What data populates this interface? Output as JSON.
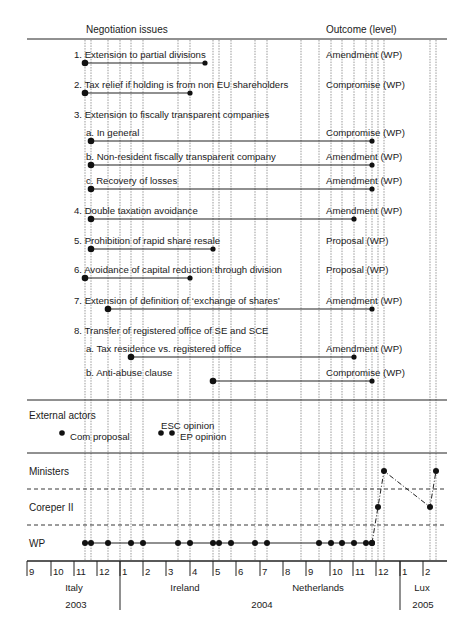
{
  "header": {
    "issues_title": "Negotiation issues",
    "outcome_title": "Outcome (level)"
  },
  "issues": [
    {
      "label": "1. Extension to partial divisions",
      "outcome": "Amendment (WP)",
      "y": 63,
      "start": 85,
      "end": 205,
      "label_x": 74
    },
    {
      "label": "2. Tax relief if holding is from non EU shareholders",
      "outcome": "Compromise (WP)",
      "y": 93,
      "start": 85,
      "end": 190,
      "label_x": 74
    },
    {
      "label": "3. Extension to fiscally transparent companies",
      "outcome": "",
      "y": null,
      "start": null,
      "end": null,
      "label_x": 74,
      "text_y": 118
    },
    {
      "label": "a. In general",
      "outcome": "Compromise (WP)",
      "y": 141,
      "start": 91,
      "end": 372,
      "label_x": 86
    },
    {
      "label": "b. Non-resident fiscally transparent company",
      "outcome": "Amendment (WP)",
      "y": 165,
      "start": 91,
      "end": 372,
      "label_x": 86
    },
    {
      "label": "c. Recovery of losses",
      "outcome": "Amendment (WP)",
      "y": 189,
      "start": 91,
      "end": 372,
      "label_x": 86
    },
    {
      "label": "4. Double taxation avoidance",
      "outcome": "Amendment (WP)",
      "y": 219,
      "start": 91,
      "end": 354,
      "label_x": 74
    },
    {
      "label": "5. Prohibition of rapid share resale",
      "outcome": "Proposal (WP)",
      "y": 249,
      "start": 91,
      "end": 213,
      "label_x": 74
    },
    {
      "label": "6. Avoidance of capital reduction through division",
      "outcome": "Proposal (WP)",
      "y": 278,
      "start": 85,
      "end": 190,
      "label_x": 74
    },
    {
      "label": "7. Extension of definition of ‘exchange of shares’",
      "outcome": "Amendment (WP)",
      "y": 309,
      "start": 108,
      "end": 372,
      "label_x": 74
    },
    {
      "label": "8. Transfer of registered office of SE and SCE",
      "outcome": "",
      "y": null,
      "start": null,
      "end": null,
      "label_x": 74,
      "text_y": 334
    },
    {
      "label": "a. Tax residence vs. registered office",
      "outcome": "Amendment (WP)",
      "y": 357,
      "start": 131,
      "end": 354,
      "label_x": 86
    },
    {
      "label": "b. Anti-abuse clause",
      "outcome": "Compromise (WP)",
      "y": 381,
      "start": 213,
      "end": 372,
      "label_x": 86
    }
  ],
  "external_actors": {
    "title": "External actors",
    "events": [
      {
        "label": "Com proposal",
        "x": 62,
        "y": 433,
        "label_dx": 8,
        "label_dy": 7
      },
      {
        "label": "ESC opinion",
        "x": 161,
        "y": 433,
        "label_dx": 0,
        "label_dy": -4
      },
      {
        "label": "EP opinion",
        "x": 172,
        "y": 433,
        "label_dx": 8,
        "label_dy": 7
      }
    ]
  },
  "levels": {
    "ministers": "Ministers",
    "coreper": "Coreper II",
    "wp": "WP"
  },
  "wp_meetings_x": [
    85,
    91,
    108,
    131,
    143,
    178,
    190,
    213,
    219,
    231,
    255,
    267,
    319,
    331,
    342,
    354,
    366,
    372
  ],
  "escalation_path": [
    {
      "x": 372,
      "y": 543,
      "level": "WP"
    },
    {
      "x": 378,
      "y": 507,
      "level": "Coreper II"
    },
    {
      "x": 384,
      "y": 471,
      "level": "Ministers"
    },
    {
      "x": 430,
      "y": 507,
      "level": "Coreper II"
    },
    {
      "x": 436,
      "y": 471,
      "level": "Ministers"
    }
  ],
  "vertical_lines_x": [
    85,
    91,
    108,
    120,
    131,
    143,
    178,
    190,
    213,
    219,
    231,
    255,
    267,
    301,
    319,
    331,
    342,
    354,
    366,
    372,
    378,
    384,
    430,
    436
  ],
  "timeline": {
    "months": [
      {
        "label": "9",
        "x": 27
      },
      {
        "label": "10",
        "x": 51
      },
      {
        "label": "11",
        "x": 74
      },
      {
        "label": "12",
        "x": 97
      },
      {
        "label": "1",
        "x": 120
      },
      {
        "label": "2",
        "x": 143
      },
      {
        "label": "3",
        "x": 166
      },
      {
        "label": "4",
        "x": 190
      },
      {
        "label": "5",
        "x": 213
      },
      {
        "label": "6",
        "x": 236
      },
      {
        "label": "7",
        "x": 260
      },
      {
        "label": "8",
        "x": 283
      },
      {
        "label": "9",
        "x": 306
      },
      {
        "label": "10",
        "x": 330
      },
      {
        "label": "11",
        "x": 353
      },
      {
        "label": "12",
        "x": 376
      },
      {
        "label": "1",
        "x": 400
      },
      {
        "label": "2",
        "x": 423
      }
    ],
    "presidencies": [
      {
        "label": "Italy",
        "x": 74
      },
      {
        "label": "Ireland",
        "x": 185
      },
      {
        "label": "Netherlands",
        "x": 318
      },
      {
        "label": "Lux",
        "x": 422
      }
    ],
    "years": [
      {
        "label": "2003",
        "x": 76
      },
      {
        "label": "2004",
        "x": 262
      },
      {
        "label": "2005",
        "x": 423
      }
    ]
  },
  "chart_data": {
    "type": "timeline",
    "title": "",
    "x_axis": {
      "unit": "month",
      "range": [
        "2003-09",
        "2005-02"
      ]
    },
    "rows": [
      {
        "issue": "1. Extension to partial divisions",
        "start": "2003-11",
        "end": "2004-05",
        "outcome": "Amendment (WP)"
      },
      {
        "issue": "2. Tax relief if holding is from non EU shareholders",
        "start": "2003-11",
        "end": "2004-04",
        "outcome": "Compromise (WP)"
      },
      {
        "issue": "3a. In general",
        "start": "2003-11",
        "end": "2004-11",
        "outcome": "Compromise (WP)"
      },
      {
        "issue": "3b. Non-resident fiscally transparent company",
        "start": "2003-11",
        "end": "2004-11",
        "outcome": "Amendment (WP)"
      },
      {
        "issue": "3c. Recovery of losses",
        "start": "2003-11",
        "end": "2004-11",
        "outcome": "Amendment (WP)"
      },
      {
        "issue": "4. Double taxation avoidance",
        "start": "2003-11",
        "end": "2004-11",
        "outcome": "Amendment (WP)"
      },
      {
        "issue": "5. Prohibition of rapid share resale",
        "start": "2003-11",
        "end": "2004-05",
        "outcome": "Proposal (WP)"
      },
      {
        "issue": "6. Avoidance of capital reduction through division",
        "start": "2003-11",
        "end": "2004-04",
        "outcome": "Proposal (WP)"
      },
      {
        "issue": "7. Extension of definition of 'exchange of shares'",
        "start": "2003-12",
        "end": "2004-11",
        "outcome": "Amendment (WP)"
      },
      {
        "issue": "8a. Tax residence vs. registered office",
        "start": "2004-01",
        "end": "2004-11",
        "outcome": "Amendment (WP)"
      },
      {
        "issue": "8b. Anti-abuse clause",
        "start": "2004-05",
        "end": "2004-11",
        "outcome": "Compromise (WP)"
      }
    ],
    "external_events": [
      "Com proposal (2003-10)",
      "ESC opinion (2004-03)",
      "EP opinion (2004-03)"
    ],
    "levels": [
      "Ministers",
      "Coreper II",
      "WP"
    ],
    "presidencies": [
      "Italy",
      "Ireland",
      "Netherlands",
      "Lux"
    ],
    "years": [
      "2003",
      "2004",
      "2005"
    ]
  }
}
